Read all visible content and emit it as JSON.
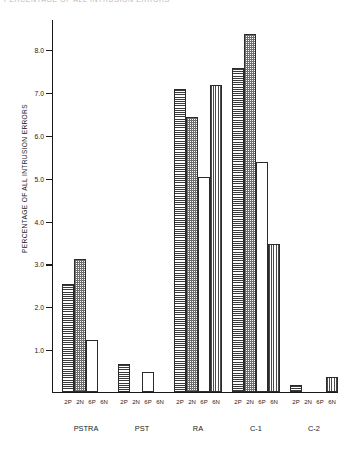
{
  "header": {
    "cropped_text": "PERCENTAGE OF ALL INTRUSION ERRORS"
  },
  "chart_data": {
    "type": "bar",
    "title": "",
    "xlabel": "",
    "ylabel": "PERCENTAGE OF ALL INTRUSION ERRORS",
    "ylim": [
      0,
      8.7
    ],
    "yticks": [
      "1.0",
      "2.0",
      "3.0",
      "4.0",
      "5.0",
      "6.0",
      "7.0",
      "8.0"
    ],
    "ytick_values": [
      1.0,
      2.0,
      3.0,
      4.0,
      5.0,
      6.0,
      7.0,
      8.0
    ],
    "grid": false,
    "legend_position": "none",
    "categories": [
      "PSTRA",
      "PST",
      "RA",
      "C-1",
      "C-2"
    ],
    "subcategories": [
      "2P",
      "2N",
      "6P",
      "6N"
    ],
    "series": [
      {
        "name": "2P",
        "pattern": "horizontal-lines",
        "values": [
          2.5,
          0.65,
          7.05,
          7.55,
          0.15
        ]
      },
      {
        "name": "2N",
        "pattern": "checkered",
        "values": [
          3.1,
          0.0,
          6.4,
          8.35,
          0.0
        ]
      },
      {
        "name": "6P",
        "pattern": "white",
        "values": [
          1.2,
          0.45,
          5.0,
          5.35,
          0.0
        ]
      },
      {
        "name": "6N",
        "pattern": "vertical-lines",
        "values": [
          0.0,
          0.0,
          7.15,
          3.45,
          0.35
        ]
      }
    ],
    "groups": [
      {
        "label": "PSTRA",
        "ticks": [
          "2P",
          "2N",
          "6P",
          "6N"
        ],
        "values": [
          2.5,
          3.1,
          1.2,
          0.0
        ]
      },
      {
        "label": "PST",
        "ticks": [
          "2P",
          "2N",
          "6P",
          "6N"
        ],
        "values": [
          0.65,
          0.0,
          0.45,
          0.0
        ]
      },
      {
        "label": "RA",
        "ticks": [
          "2P",
          "2N",
          "6P",
          "6N"
        ],
        "values": [
          7.05,
          6.4,
          5.0,
          7.15
        ]
      },
      {
        "label": "C-1",
        "ticks": [
          "2P",
          "2N",
          "6P",
          "6N"
        ],
        "values": [
          7.55,
          8.35,
          5.35,
          3.45
        ]
      },
      {
        "label": "C-2",
        "ticks": [
          "2P",
          "2N",
          "6P",
          "6N"
        ],
        "values": [
          0.15,
          0.0,
          0.0,
          0.35
        ]
      }
    ]
  }
}
